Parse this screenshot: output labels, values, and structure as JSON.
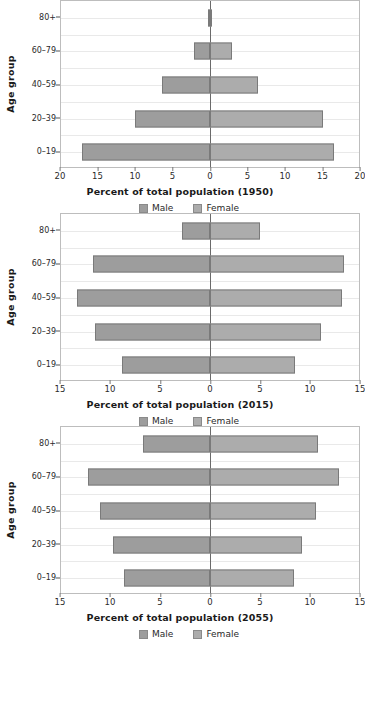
{
  "axis": {
    "ylabel": "Age group",
    "age_groups": [
      "80+",
      "60–79",
      "40–59",
      "20–39",
      "0–19"
    ]
  },
  "legend": {
    "male_label": "Male",
    "female_label": "Female",
    "male_color": "#9d9d9d",
    "female_color": "#acacac"
  },
  "colors": {
    "bar_fill": "#a3a3a3",
    "bar_border": "#7a7a7a",
    "grid": "#e9e9e9",
    "zero_line": "#6a6a6a",
    "plot_border": "#bdbdbd",
    "text": "#1a1a1a"
  },
  "chart_data": [
    {
      "type": "bar",
      "orientation": "population-pyramid",
      "title": "Percent of total population (1950)",
      "xlabel": "Percent of total population (1950)",
      "ylabel": "Age group",
      "grid": true,
      "legend_position": "bottom",
      "xlim": [
        -20,
        20
      ],
      "xticks": [
        20,
        15,
        10,
        5,
        0,
        5,
        10,
        15,
        20
      ],
      "categories": [
        "0–19",
        "20–39",
        "40–59",
        "60–79",
        "80+"
      ],
      "series": [
        {
          "name": "Male",
          "side": "left",
          "values": [
            17.2,
            10.1,
            6.4,
            2.1,
            0.3
          ]
        },
        {
          "name": "Female",
          "side": "right",
          "values": [
            16.7,
            15.2,
            6.5,
            3.0,
            0.3
          ]
        }
      ]
    },
    {
      "type": "bar",
      "orientation": "population-pyramid",
      "title": "Percent of total population (2015)",
      "xlabel": "Percent of total population (2015)",
      "ylabel": "Age group",
      "grid": true,
      "legend_position": "bottom",
      "xlim": [
        -15,
        15
      ],
      "xticks": [
        15,
        10,
        5,
        0,
        5,
        10,
        15
      ],
      "categories": [
        "0–19",
        "20–39",
        "40–59",
        "60–79",
        "80+"
      ],
      "series": [
        {
          "name": "Male",
          "side": "left",
          "values": [
            8.9,
            11.6,
            13.4,
            11.8,
            2.8
          ]
        },
        {
          "name": "Female",
          "side": "right",
          "values": [
            8.6,
            11.2,
            13.3,
            13.5,
            5.0
          ]
        }
      ]
    },
    {
      "type": "bar",
      "orientation": "population-pyramid",
      "title": "Percent of total population (2055)",
      "xlabel": "Percent of total population (2055)",
      "ylabel": "Age group",
      "grid": true,
      "legend_position": "bottom",
      "xlim": [
        -15,
        15
      ],
      "xticks": [
        15,
        10,
        5,
        0,
        5,
        10,
        15
      ],
      "categories": [
        "0–19",
        "20–39",
        "40–59",
        "60–79",
        "80+"
      ],
      "series": [
        {
          "name": "Male",
          "side": "left",
          "values": [
            8.7,
            9.8,
            11.1,
            12.3,
            6.7
          ]
        },
        {
          "name": "Female",
          "side": "right",
          "values": [
            8.5,
            9.3,
            10.7,
            13.0,
            10.9
          ]
        }
      ]
    }
  ]
}
